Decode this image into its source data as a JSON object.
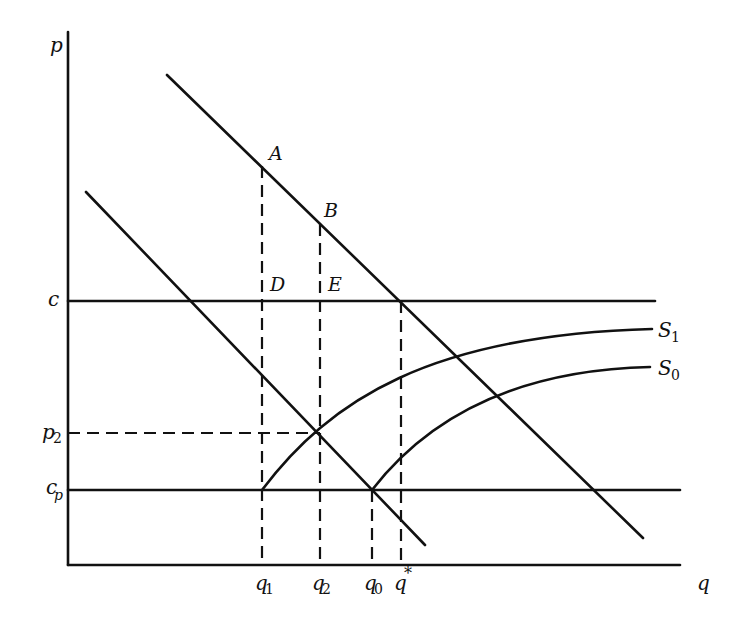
{
  "diagram": {
    "type": "supply-demand diagram",
    "axes": {
      "y_label": "p",
      "x_label": "q"
    },
    "price_levels": [
      {
        "id": "c",
        "label": "c",
        "sub": "",
        "y": 301,
        "style": "solid"
      },
      {
        "id": "p2",
        "label": "p",
        "sub": "2",
        "y": 433,
        "style": "dashed"
      },
      {
        "id": "cp",
        "label": "c",
        "sub": "p",
        "y": 490,
        "style": "solid"
      }
    ],
    "quantity_levels": [
      {
        "id": "q1",
        "label": "q",
        "sub": "1",
        "x": 262
      },
      {
        "id": "q2",
        "label": "q",
        "sub": "2",
        "x": 320
      },
      {
        "id": "q0",
        "label": "q",
        "sub": "0",
        "x": 372
      },
      {
        "id": "qstar",
        "label": "q",
        "sup": "*",
        "x": 401
      }
    ],
    "points": [
      {
        "label": "A",
        "x": 262,
        "y": 166
      },
      {
        "label": "B",
        "x": 320,
        "y": 224
      },
      {
        "label": "D",
        "x": 262,
        "y": 301
      },
      {
        "label": "E",
        "x": 320,
        "y": 301
      }
    ],
    "curves": [
      {
        "id": "S1",
        "label": "S",
        "sub": "1"
      },
      {
        "id": "S0",
        "label": "S",
        "sub": "0"
      }
    ],
    "lines": [
      {
        "id": "demand-upper",
        "label": ""
      },
      {
        "id": "demand-lower",
        "label": ""
      }
    ]
  }
}
